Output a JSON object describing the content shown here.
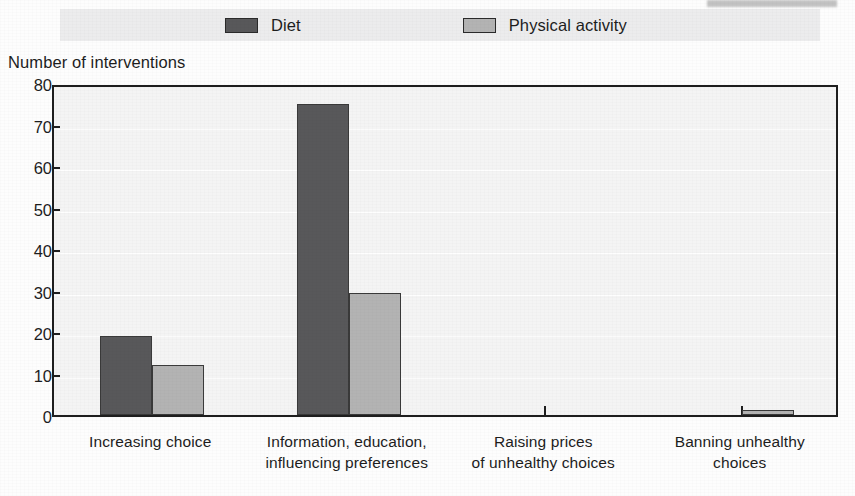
{
  "legend": {
    "items": [
      {
        "label": "Diet",
        "color": "#58585a",
        "swatch_name": "legend-swatch-diet"
      },
      {
        "label": "Physical activity",
        "color": "#b3b3b3",
        "swatch_name": "legend-swatch-physical-activity"
      }
    ]
  },
  "axis": {
    "y_title": "Number of interventions",
    "y_ticks": [
      "80",
      "70",
      "60",
      "50",
      "40",
      "30",
      "20",
      "10",
      "0"
    ]
  },
  "chart_data": {
    "type": "bar",
    "title": "",
    "subtitle": "",
    "xlabel": "",
    "ylabel": "Number of interventions",
    "ylim": [
      0,
      80
    ],
    "ytick_values": [
      0,
      10,
      20,
      30,
      40,
      50,
      60,
      70,
      80
    ],
    "grid": true,
    "legend_position": "top",
    "categories": [
      "Increasing choice",
      "Information, education, influencing preferences",
      "Raising prices of unhealthy choices",
      "Banning unhealthy choices"
    ],
    "category_lines": [
      [
        "Increasing choice"
      ],
      [
        "Information, education,",
        "influencing preferences"
      ],
      [
        "Raising prices",
        "of unhealthy choices"
      ],
      [
        "Banning unhealthy",
        "choices"
      ]
    ],
    "series": [
      {
        "name": "Diet",
        "color": "#58585a",
        "values": [
          19,
          75,
          0,
          0
        ]
      },
      {
        "name": "Physical activity",
        "color": "#b3b3b3",
        "values": [
          12,
          29.5,
          0,
          1
        ]
      }
    ]
  }
}
